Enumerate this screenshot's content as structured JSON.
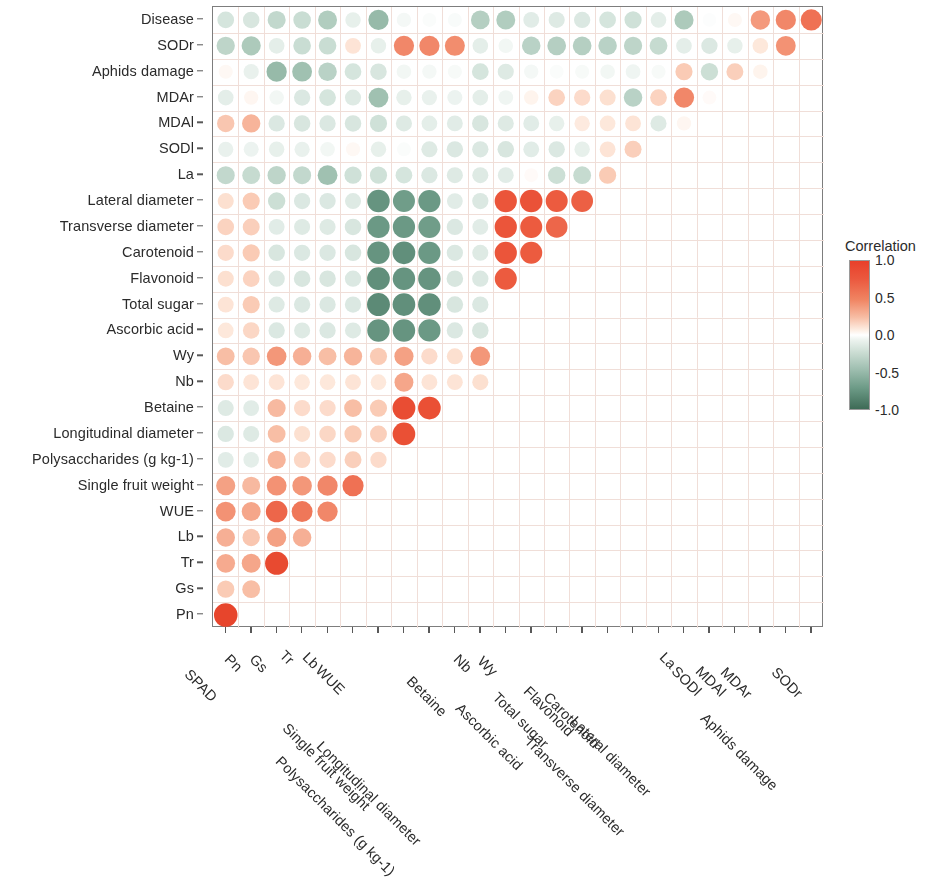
{
  "figure": {
    "type": "correlation-matrix",
    "legend": {
      "title": "Correlation",
      "ticks": [
        "1.0",
        "0.5",
        "0.0",
        "-0.5",
        "-1.0"
      ],
      "tick_values": [
        1.0,
        0.5,
        0.0,
        -0.5,
        -1.0
      ],
      "color_positive": "#e8402a",
      "color_zero": "#ffffff",
      "color_negative": "#3e6b56"
    }
  },
  "chart_data": {
    "type": "heatmap",
    "title": "",
    "xlabel": "",
    "ylabel": "",
    "zlim": [
      -1.0,
      1.0
    ],
    "grid": true,
    "legend_position": "right",
    "marker": "circle",
    "x": [
      "SPAD",
      "Pn",
      "Gs",
      "Tr",
      "Lb",
      "WUE",
      "Single fruit weight",
      "Polysaccharides (g kg-1)",
      "Longitudinal diameter",
      "Betaine",
      "Nb",
      "Wy",
      "Ascorbic acid",
      "Total sugar",
      "Flavonoid",
      "Carotenoid",
      "Transverse diameter",
      "Lateral diameter",
      "La",
      "SODl",
      "MDAl",
      "MDAr",
      "Aphids damage",
      "SODr"
    ],
    "y": [
      "Disease",
      "SODr",
      "Aphids damage",
      "MDAr",
      "MDAl",
      "SODl",
      "La",
      "Lateral diameter",
      "Transverse diameter",
      "Carotenoid",
      "Flavonoid",
      "Total sugar",
      "Ascorbic acid",
      "Wy",
      "Nb",
      "Betaine",
      "Longitudinal diameter",
      "Polysaccharides (g kg-1)",
      "Single fruit weight",
      "WUE",
      "Lb",
      "Tr",
      "Gs",
      "Pn"
    ],
    "values": [
      [
        -0.3,
        -0.28,
        -0.42,
        -0.38,
        -0.5,
        -0.18,
        -0.62,
        -0.08,
        -0.04,
        -0.05,
        -0.48,
        -0.5,
        -0.22,
        -0.24,
        -0.26,
        -0.3,
        -0.34,
        -0.2,
        -0.52,
        -0.02,
        0.06,
        0.55,
        0.62,
        0.7
      ],
      [
        -0.44,
        -0.52,
        -0.2,
        -0.38,
        -0.38,
        0.22,
        -0.18,
        0.62,
        0.62,
        0.6,
        -0.2,
        -0.1,
        -0.46,
        -0.48,
        -0.48,
        -0.46,
        -0.44,
        -0.4,
        -0.2,
        -0.26,
        -0.18,
        0.2,
        0.58,
        null
      ],
      [
        0.06,
        -0.16,
        -0.62,
        -0.58,
        -0.46,
        -0.3,
        -0.28,
        -0.1,
        -0.08,
        -0.06,
        -0.3,
        -0.24,
        -0.08,
        -0.04,
        -0.06,
        -0.1,
        -0.12,
        -0.06,
        0.34,
        -0.36,
        0.32,
        0.1,
        null,
        null
      ],
      [
        -0.2,
        0.08,
        -0.1,
        -0.26,
        -0.3,
        -0.24,
        -0.58,
        -0.18,
        -0.16,
        -0.14,
        -0.2,
        -0.12,
        0.1,
        0.3,
        0.26,
        0.24,
        -0.46,
        0.3,
        0.62,
        0.04,
        null,
        null,
        null
      ],
      [
        0.36,
        0.44,
        -0.26,
        -0.28,
        -0.26,
        -0.28,
        -0.34,
        -0.24,
        -0.2,
        -0.22,
        -0.28,
        -0.24,
        -0.22,
        -0.18,
        0.18,
        0.2,
        0.22,
        -0.24,
        0.08,
        null,
        null,
        null,
        null
      ],
      [
        -0.16,
        -0.14,
        -0.18,
        -0.16,
        -0.1,
        0.06,
        -0.18,
        -0.04,
        -0.24,
        -0.26,
        -0.26,
        -0.28,
        -0.22,
        -0.26,
        -0.18,
        0.22,
        0.32,
        null,
        null,
        null,
        null,
        null,
        null
      ],
      [
        -0.42,
        -0.4,
        -0.44,
        -0.42,
        -0.58,
        -0.34,
        -0.34,
        -0.3,
        -0.26,
        -0.24,
        -0.24,
        -0.22,
        0.04,
        -0.36,
        -0.4,
        0.34,
        null,
        null,
        null,
        null,
        null,
        null,
        null
      ],
      [
        0.24,
        0.34,
        -0.36,
        -0.26,
        -0.26,
        -0.24,
        -0.82,
        -0.78,
        -0.8,
        -0.22,
        -0.26,
        0.8,
        0.82,
        0.78,
        0.76,
        null,
        null,
        null,
        null,
        null,
        null,
        null,
        null
      ],
      [
        0.3,
        0.32,
        -0.22,
        -0.24,
        -0.24,
        -0.28,
        -0.8,
        -0.8,
        -0.78,
        -0.26,
        -0.22,
        0.8,
        0.78,
        0.74,
        null,
        null,
        null,
        null,
        null,
        null,
        null,
        null,
        null
      ],
      [
        0.26,
        0.34,
        -0.28,
        -0.26,
        -0.26,
        -0.28,
        -0.82,
        -0.84,
        -0.8,
        -0.26,
        -0.24,
        0.8,
        0.78,
        null,
        null,
        null,
        null,
        null,
        null,
        null,
        null,
        null,
        null
      ],
      [
        0.24,
        0.3,
        -0.26,
        -0.28,
        -0.28,
        -0.26,
        -0.84,
        -0.82,
        -0.82,
        -0.28,
        -0.26,
        0.78,
        null,
        null,
        null,
        null,
        null,
        null,
        null,
        null,
        null,
        null,
        null
      ],
      [
        0.22,
        0.34,
        -0.24,
        -0.26,
        -0.26,
        -0.26,
        -0.86,
        -0.84,
        -0.84,
        -0.28,
        -0.26,
        null,
        null,
        null,
        null,
        null,
        null,
        null,
        null,
        null,
        null,
        null,
        null
      ],
      [
        0.2,
        0.28,
        -0.26,
        -0.24,
        -0.26,
        -0.24,
        -0.82,
        -0.82,
        -0.8,
        -0.26,
        -0.28,
        null,
        null,
        null,
        null,
        null,
        null,
        null,
        null,
        null,
        null,
        null,
        null
      ],
      [
        0.4,
        0.36,
        0.56,
        0.46,
        0.4,
        0.44,
        0.34,
        0.52,
        0.26,
        0.24,
        0.56,
        null,
        null,
        null,
        null,
        null,
        null,
        null,
        null,
        null,
        null,
        null,
        null
      ],
      [
        0.26,
        0.22,
        0.22,
        0.2,
        0.2,
        0.22,
        0.2,
        0.5,
        0.22,
        0.22,
        0.24,
        null,
        null,
        null,
        null,
        null,
        null,
        null,
        null,
        null,
        null,
        null,
        null
      ],
      [
        -0.24,
        -0.22,
        0.42,
        0.26,
        0.26,
        0.4,
        0.34,
        0.86,
        0.84,
        null,
        null,
        null,
        null,
        null,
        null,
        null,
        null,
        null,
        null,
        null,
        null,
        null,
        null
      ],
      [
        -0.26,
        -0.24,
        0.4,
        0.24,
        0.28,
        0.34,
        0.32,
        0.84,
        null,
        null,
        null,
        null,
        null,
        null,
        null,
        null,
        null,
        null,
        null,
        null,
        null,
        null,
        null
      ],
      [
        -0.22,
        -0.2,
        0.44,
        0.28,
        0.26,
        0.32,
        0.26,
        null,
        null,
        null,
        null,
        null,
        null,
        null,
        null,
        null,
        null,
        null,
        null,
        null,
        null,
        null,
        null
      ],
      [
        0.52,
        0.42,
        0.58,
        0.56,
        0.62,
        0.7,
        null,
        null,
        null,
        null,
        null,
        null,
        null,
        null,
        null,
        null,
        null,
        null,
        null,
        null,
        null,
        null,
        null
      ],
      [
        0.58,
        0.5,
        0.74,
        0.68,
        0.62,
        null,
        null,
        null,
        null,
        null,
        null,
        null,
        null,
        null,
        null,
        null,
        null,
        null,
        null,
        null,
        null,
        null,
        null
      ],
      [
        0.46,
        0.36,
        0.52,
        0.46,
        null,
        null,
        null,
        null,
        null,
        null,
        null,
        null,
        null,
        null,
        null,
        null,
        null,
        null,
        null,
        null,
        null,
        null,
        null
      ],
      [
        0.48,
        0.5,
        0.88,
        null,
        null,
        null,
        null,
        null,
        null,
        null,
        null,
        null,
        null,
        null,
        null,
        null,
        null,
        null,
        null,
        null,
        null,
        null,
        null
      ],
      [
        0.34,
        0.4,
        null,
        null,
        null,
        null,
        null,
        null,
        null,
        null,
        null,
        null,
        null,
        null,
        null,
        null,
        null,
        null,
        null,
        null,
        null,
        null,
        null
      ],
      [
        0.92,
        null,
        null,
        null,
        null,
        null,
        null,
        null,
        null,
        null,
        null,
        null,
        null,
        null,
        null,
        null,
        null,
        null,
        null,
        null,
        null,
        null,
        null
      ]
    ]
  }
}
